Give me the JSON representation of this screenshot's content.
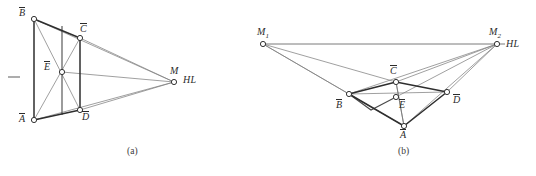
{
  "figure": {
    "background_color": "#ffffff",
    "stroke_color": "#555555",
    "heavy_stroke_color": "#2e2e2e",
    "node_fill": "#ffffff",
    "label_color": "#2b2b2b",
    "panels": [
      {
        "id": "panel-a",
        "caption": "(a)",
        "caption_pos": {
          "x": 127,
          "y": 150
        },
        "description": "one-point perspective construction with single vanishing point M on horizon line HL",
        "tick_mark": {
          "x1": 8,
          "y1": 77,
          "x2": 20,
          "y2": 77
        },
        "points": [
          {
            "name": "B-bar",
            "label": "B",
            "overbar": true,
            "x": 34,
            "y": 19,
            "label_x": 19,
            "label_y": 8,
            "radius": 2.6
          },
          {
            "name": "C-bar",
            "label": "C",
            "overbar": true,
            "x": 80,
            "y": 38,
            "label_x": 80,
            "label_y": 24,
            "radius": 2.6
          },
          {
            "name": "E-bar",
            "label": "E",
            "overbar": true,
            "x": 62,
            "y": 72,
            "label_x": 44,
            "label_y": 62,
            "radius": 2.6
          },
          {
            "name": "M",
            "label": "M",
            "overbar": false,
            "x": 174,
            "y": 82,
            "label_x": 170,
            "label_y": 67,
            "radius": 2.6
          },
          {
            "name": "D-bar",
            "label": "D",
            "overbar": true,
            "x": 80,
            "y": 110,
            "label_x": 82,
            "label_y": 112,
            "radius": 2.6
          },
          {
            "name": "A-bar",
            "label": "A",
            "overbar": true,
            "x": 34,
            "y": 120,
            "label_x": 19,
            "label_y": 114,
            "radius": 2.6
          }
        ],
        "horizon_label": {
          "text": "HL",
          "x": 183,
          "y": 76
        },
        "heavy_edges": [
          {
            "name": "edge-B-A",
            "from": "B-bar",
            "to": "A-bar"
          },
          {
            "name": "edge-B-C",
            "from": "B-bar",
            "to": "C-bar"
          },
          {
            "name": "edge-C-D",
            "from": "C-bar",
            "to": "D-bar"
          },
          {
            "name": "edge-A-D",
            "from": "A-bar",
            "to": "D-bar"
          }
        ],
        "light_edges": [
          {
            "name": "diagonal-B-D",
            "from": "B-bar",
            "to": "D-bar"
          },
          {
            "name": "diagonal-A-C",
            "from": "A-bar",
            "to": "C-bar"
          },
          {
            "name": "ray-B-M",
            "from": "B-bar",
            "to": "M"
          },
          {
            "name": "ray-C-M",
            "from": "C-bar",
            "to": "M"
          },
          {
            "name": "ray-D-M",
            "from": "D-bar",
            "to": "M"
          },
          {
            "name": "ray-A-M",
            "from": "A-bar",
            "to": "M"
          },
          {
            "name": "ray-E-M",
            "from": "E-bar",
            "to": "M"
          }
        ],
        "median_line": {
          "name": "median-vertical",
          "x1": 62,
          "y1": 26,
          "x2": 62,
          "y2": 115
        }
      },
      {
        "id": "panel-b",
        "caption": "(b)",
        "caption_pos": {
          "x": 398,
          "y": 150
        },
        "description": "two-point perspective construction with vanishing points M1 and M2 on horizon line HL",
        "points": [
          {
            "name": "M1",
            "label": "M",
            "sub": "1",
            "overbar": false,
            "x": 263,
            "y": 44,
            "label_x": 258,
            "label_y": 28,
            "radius": 2.6
          },
          {
            "name": "M2",
            "label": "M",
            "sub": "2",
            "overbar": false,
            "x": 497,
            "y": 44,
            "label_x": 490,
            "label_y": 28,
            "radius": 2.6
          },
          {
            "name": "C-bar",
            "label": "C",
            "overbar": true,
            "x": 396,
            "y": 82,
            "label_x": 390,
            "label_y": 66,
            "radius": 2.6
          },
          {
            "name": "E-bar",
            "label": "E",
            "overbar": true,
            "x": 396,
            "y": 97,
            "label_x": 399,
            "label_y": 100,
            "radius": 2.6
          },
          {
            "name": "B-bar",
            "label": "B",
            "overbar": true,
            "x": 349,
            "y": 94,
            "label_x": 337,
            "label_y": 100,
            "radius": 2.6
          },
          {
            "name": "D-bar",
            "label": "D",
            "overbar": true,
            "x": 447,
            "y": 92,
            "label_x": 453,
            "label_y": 95,
            "radius": 2.6
          },
          {
            "name": "A-bar",
            "label": "A",
            "overbar": true,
            "x": 404,
            "y": 126,
            "label_x": 400,
            "label_y": 130,
            "radius": 2.6
          }
        ],
        "horizon_label": {
          "text": "HL",
          "x": 506,
          "y": 40
        },
        "horizon_line": {
          "name": "horizon-line",
          "x1": 263,
          "y1": 44,
          "x2": 505,
          "y2": 44
        },
        "heavy_edges": [
          {
            "name": "edge-B-C",
            "from": "B-bar",
            "to": "C-bar"
          },
          {
            "name": "edge-C-D",
            "from": "C-bar",
            "to": "D-bar"
          },
          {
            "name": "edge-D-A",
            "from": "D-bar",
            "to": "A-bar"
          },
          {
            "name": "edge-A-B",
            "from": "A-bar",
            "to": "B-bar"
          }
        ],
        "light_edges": [
          {
            "name": "diagonal-B-D",
            "from": "B-bar",
            "to": "D-bar"
          },
          {
            "name": "diagonal-C-A",
            "from": "C-bar",
            "to": "A-bar"
          },
          {
            "name": "ray-M1-B",
            "from": "M1",
            "to": "B-bar"
          },
          {
            "name": "ray-M1-A",
            "from": "M1",
            "to": "A-bar"
          },
          {
            "name": "ray-M1-C",
            "from": "M1",
            "to": "C-bar"
          },
          {
            "name": "ray-M2-B",
            "from": "M2",
            "to": "B-bar"
          },
          {
            "name": "ray-M2-A",
            "from": "M2",
            "to": "A-bar"
          },
          {
            "name": "ray-M2-C",
            "from": "M2",
            "to": "C-bar"
          },
          {
            "name": "ray-M2-D",
            "from": "M2",
            "to": "D-bar"
          },
          {
            "name": "ray-M2-E",
            "from": "M2",
            "to": "E-bar"
          }
        ],
        "median_line": {
          "name": "median-vertical",
          "x1": 396,
          "y1": 82,
          "x2": 405,
          "y2": 126
        },
        "inner-segment": {
          "name": "inner-fold",
          "x1": 349,
          "y1": 94,
          "x2": 371,
          "y2": 110,
          "x3": 396,
          "y3": 97
        }
      }
    ]
  }
}
